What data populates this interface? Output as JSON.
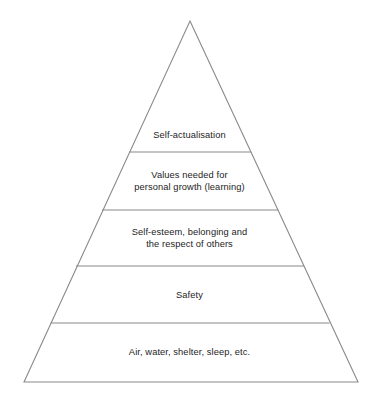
{
  "figure": {
    "name": "needs-hierarchy-pyramid",
    "shape": "triangle",
    "background_color": "#ffffff",
    "stroke_color": "#8a8a8a",
    "text_color": "#1d1d1d",
    "apex": {
      "x": 190,
      "y": 21
    },
    "base_left": {
      "x": 24,
      "y": 382
    },
    "base_right": {
      "x": 358,
      "y": 382
    },
    "divider_y": [
      152,
      210,
      266,
      323
    ]
  },
  "tiers": [
    {
      "index": 1,
      "name": "self-actualisation",
      "label": "Self-actualisation",
      "text_center_y": 135
    },
    {
      "index": 2,
      "name": "values-personal-growth",
      "label": "Values needed for\npersonal growth (learning)",
      "text_center_y": 181
    },
    {
      "index": 3,
      "name": "self-esteem-belonging",
      "label": "Self-esteem, belonging and\nthe respect of others",
      "text_center_y": 238
    },
    {
      "index": 4,
      "name": "safety",
      "label": "Safety",
      "text_center_y": 295
    },
    {
      "index": 5,
      "name": "physiological-needs",
      "label": "Air, water, shelter, sleep, etc.",
      "text_center_y": 352
    }
  ]
}
